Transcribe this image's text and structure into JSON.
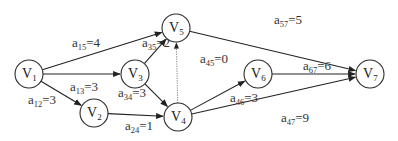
{
  "diagram": {
    "type": "activity-on-edge network",
    "nodes": [
      {
        "id": "V1",
        "base": "V",
        "sub": "1",
        "x": 29,
        "y": 74
      },
      {
        "id": "V2",
        "base": "V",
        "sub": "2",
        "x": 94,
        "y": 113
      },
      {
        "id": "V3",
        "base": "V",
        "sub": "3",
        "x": 135,
        "y": 74
      },
      {
        "id": "V4",
        "base": "V",
        "sub": "4",
        "x": 178,
        "y": 117
      },
      {
        "id": "V5",
        "base": "V",
        "sub": "5",
        "x": 176,
        "y": 28
      },
      {
        "id": "V6",
        "base": "V",
        "sub": "6",
        "x": 258,
        "y": 74
      },
      {
        "id": "V7",
        "base": "V",
        "sub": "7",
        "x": 370,
        "y": 74
      }
    ],
    "edges": [
      {
        "from": "V1",
        "to": "V5",
        "base": "a",
        "sub": "15",
        "value": "4",
        "style": "solid"
      },
      {
        "from": "V1",
        "to": "V3",
        "base": "a",
        "sub": "13",
        "value": "3",
        "style": "solid"
      },
      {
        "from": "V1",
        "to": "V2",
        "base": "a",
        "sub": "12",
        "value": "3",
        "style": "solid"
      },
      {
        "from": "V3",
        "to": "V5",
        "base": "a",
        "sub": "35",
        "value": "2",
        "style": "solid"
      },
      {
        "from": "V3",
        "to": "V4",
        "base": "a",
        "sub": "34",
        "value": "3",
        "style": "solid"
      },
      {
        "from": "V2",
        "to": "V4",
        "base": "a",
        "sub": "24",
        "value": "1",
        "style": "solid"
      },
      {
        "from": "V4",
        "to": "V5",
        "base": "a",
        "sub": "45",
        "value": "0",
        "style": "dotted"
      },
      {
        "from": "V4",
        "to": "V6",
        "base": "a",
        "sub": "46",
        "value": "3",
        "style": "solid"
      },
      {
        "from": "V4",
        "to": "V7",
        "base": "a",
        "sub": "47",
        "value": "9",
        "style": "solid"
      },
      {
        "from": "V5",
        "to": "V7",
        "base": "a",
        "sub": "57",
        "value": "5",
        "style": "solid"
      },
      {
        "from": "V6",
        "to": "V7",
        "base": "a",
        "sub": "67",
        "value": "6",
        "style": "solid"
      }
    ],
    "labels": {
      "a15": "a15=4",
      "a13": "a13=3",
      "a12": "a12=3",
      "a35": "a35=2",
      "a34": "a34=3",
      "a24": "a24=1",
      "a45": "a45=0",
      "a46": "a46=3",
      "a47": "a47=9",
      "a57": "a57=5",
      "a67": "a67=6"
    },
    "colors": {
      "stroke": "#222222",
      "dotted_edge": "#777777",
      "text": "#333333",
      "background": "#ffffff"
    }
  }
}
